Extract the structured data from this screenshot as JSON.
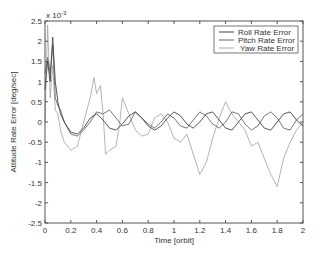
{
  "chart_data": {
    "type": "line",
    "title": "",
    "xlabel": "Time [orbit]",
    "ylabel": "Attitude Rate Error [deg/sec]",
    "y_multiplier": "x 10^-3",
    "xlim": [
      0,
      2
    ],
    "ylim": [
      -2.5,
      2.5
    ],
    "xticks": [
      "0",
      "0.2",
      "0.4",
      "0.6",
      "0.8",
      "1",
      "1.2",
      "1.4",
      "1.6",
      "1.8",
      "2"
    ],
    "yticks": [
      "2.5",
      "2",
      "1.5",
      "1",
      "0.5",
      "0",
      "-0.5",
      "-1",
      "-1.5",
      "-2",
      "-2.5"
    ],
    "grid": false,
    "legend_position": "upper right",
    "legend": [
      "Roll Rate Error",
      "Pitch Rate Error",
      "Yaw Rate Error"
    ],
    "series": [
      {
        "name": "Roll Rate Error",
        "color": "#444444",
        "x": [
          0,
          0.02,
          0.04,
          0.06,
          0.08,
          0.1,
          0.12,
          0.15,
          0.2,
          0.25,
          0.3,
          0.35,
          0.4,
          0.45,
          0.5,
          0.55,
          0.6,
          0.65,
          0.7,
          0.75,
          0.8,
          0.85,
          0.9,
          0.95,
          1.0,
          1.05,
          1.1,
          1.15,
          1.2,
          1.25,
          1.3,
          1.35,
          1.4,
          1.45,
          1.5,
          1.55,
          1.6,
          1.65,
          1.7,
          1.75,
          1.8,
          1.85,
          1.9,
          1.95,
          2.0
        ],
        "values": [
          0.8,
          1.5,
          1.0,
          2.1,
          1.0,
          0.5,
          0.2,
          0.0,
          -0.25,
          -0.3,
          -0.15,
          0.1,
          0.2,
          0.05,
          -0.15,
          -0.2,
          -0.05,
          0.15,
          0.25,
          0.1,
          -0.1,
          -0.2,
          -0.1,
          0.1,
          0.25,
          0.15,
          -0.05,
          -0.15,
          0.0,
          0.2,
          0.25,
          0.05,
          -0.15,
          -0.2,
          0.0,
          0.2,
          0.25,
          0.05,
          -0.15,
          -0.2,
          0.0,
          0.2,
          0.25,
          0.05,
          -0.1
        ]
      },
      {
        "name": "Pitch Rate Error",
        "color": "#666666",
        "x": [
          0,
          0.02,
          0.04,
          0.06,
          0.08,
          0.1,
          0.12,
          0.15,
          0.2,
          0.25,
          0.3,
          0.35,
          0.4,
          0.45,
          0.5,
          0.55,
          0.6,
          0.65,
          0.7,
          0.75,
          0.8,
          0.85,
          0.9,
          0.95,
          1.0,
          1.05,
          1.1,
          1.15,
          1.2,
          1.25,
          1.3,
          1.35,
          1.4,
          1.45,
          1.5,
          1.55,
          1.6,
          1.65,
          1.7,
          1.75,
          1.8,
          1.85,
          1.9,
          1.95,
          2.0
        ],
        "values": [
          1.2,
          1.6,
          1.2,
          1.9,
          0.6,
          0.4,
          0.3,
          0.0,
          -0.3,
          -0.35,
          -0.2,
          0.0,
          0.25,
          0.2,
          0.3,
          0.1,
          -0.1,
          -0.05,
          0.25,
          0.1,
          -0.05,
          -0.15,
          0.0,
          0.2,
          0.1,
          -0.1,
          -0.15,
          0.05,
          0.25,
          0.15,
          -0.05,
          -0.15,
          0.0,
          0.25,
          0.2,
          -0.05,
          -0.2,
          -0.1,
          0.15,
          0.25,
          0.1,
          -0.15,
          -0.2,
          0.05,
          0.2
        ]
      },
      {
        "name": "Yaw Rate Error",
        "color": "#aaaaaa",
        "x": [
          0,
          0.02,
          0.04,
          0.06,
          0.08,
          0.1,
          0.12,
          0.15,
          0.2,
          0.25,
          0.3,
          0.35,
          0.38,
          0.4,
          0.43,
          0.45,
          0.47,
          0.5,
          0.55,
          0.58,
          0.6,
          0.65,
          0.7,
          0.75,
          0.8,
          0.85,
          0.9,
          0.95,
          1.0,
          1.05,
          1.1,
          1.15,
          1.2,
          1.25,
          1.3,
          1.35,
          1.4,
          1.45,
          1.5,
          1.55,
          1.6,
          1.65,
          1.7,
          1.75,
          1.8,
          1.85,
          1.9,
          1.95,
          2.0
        ],
        "values": [
          0.0,
          2.4,
          0.6,
          1.4,
          0.3,
          0.2,
          -0.2,
          -0.5,
          -0.7,
          -0.6,
          0.0,
          0.6,
          1.1,
          0.7,
          0.9,
          0.2,
          -0.8,
          -0.7,
          -0.6,
          0.0,
          0.6,
          0.2,
          -0.2,
          -0.35,
          -0.3,
          0.1,
          0.2,
          0.0,
          -0.4,
          -0.5,
          -0.3,
          -0.8,
          -1.3,
          -1.0,
          -0.4,
          0.1,
          0.5,
          0.2,
          0.0,
          -0.2,
          -0.6,
          -0.5,
          -0.9,
          -1.3,
          -1.6,
          -0.9,
          -0.5,
          -0.2,
          0.0
        ]
      }
    ]
  },
  "axes": {
    "x_multiplier_label": "x 10",
    "x_multiplier_exp": "-3"
  }
}
